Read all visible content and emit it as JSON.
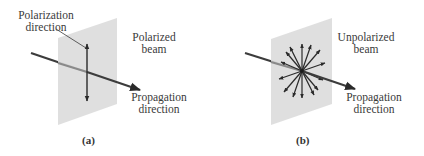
{
  "panels": [
    {
      "id": "a",
      "caption": "(a)",
      "labels": {
        "polarization_line1": "Polarization",
        "polarization_line2": "direction",
        "beam_line1": "Polarized",
        "beam_line2": "beam",
        "propagation_line1": "Propagation",
        "propagation_line2": "direction"
      }
    },
    {
      "id": "b",
      "caption": "(b)",
      "labels": {
        "beam_line1": "Unpolarized",
        "beam_line2": "beam",
        "propagation_line1": "Propagation",
        "propagation_line2": "direction"
      }
    }
  ],
  "colors": {
    "plane": "#dcdcdc",
    "beam": "#3c3c3c",
    "arrow": "#2a2a2a",
    "text": "#3a3a3a"
  }
}
